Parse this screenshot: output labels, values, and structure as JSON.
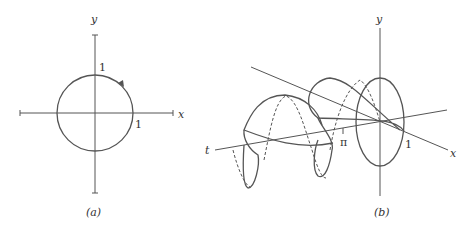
{
  "panel_a": {
    "caption": "(a)",
    "x_label": "x",
    "y_label": "y",
    "tick_x": "1",
    "tick_y": "1",
    "curve": "unit circle, counterclockwise arrow"
  },
  "panel_b": {
    "caption": "(b)",
    "x_label": "x",
    "y_label": "y",
    "t_label": "t",
    "tick_pi": "π",
    "tick_one": "1",
    "curve": "helix around t-axis, dashed back portions"
  },
  "colors": {
    "stroke": "#555555",
    "text": "#333333"
  }
}
